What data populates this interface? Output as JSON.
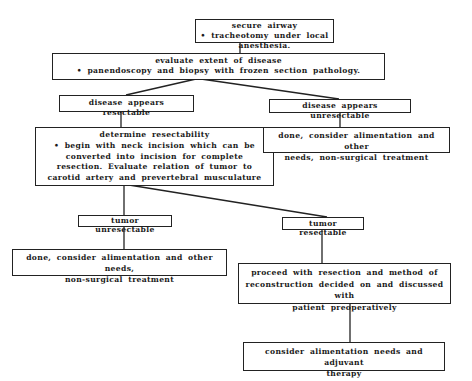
{
  "diagram": {
    "type": "flowchart",
    "nodes": {
      "secure_airway": {
        "title": "secure airway",
        "bullet": "• tracheotomy under local anesthesia."
      },
      "evaluate_extent": {
        "title": "evaluate extent of disease",
        "bullet": "• panendoscopy and biopsy with frozen section pathology."
      },
      "disease_resectable": {
        "label": "disease appears resectable"
      },
      "disease_unresectable": {
        "label": "disease appears unresectable"
      },
      "determine_resectability": {
        "title": "determine resectability",
        "lines": [
          "• begin with neck incision which can be",
          "converted into incision for complete",
          "resection.  Evaluate relation of tumor to",
          "carotid artery and prevertebral musculature"
        ]
      },
      "done_right": {
        "lines": [
          "done, consider alimentation and other",
          "needs, non-surgical treatment"
        ]
      },
      "tumor_unresectable": {
        "label": "tumor unresectable"
      },
      "tumor_resectable": {
        "label": "tumor resectable"
      },
      "done_left": {
        "lines": [
          "done, consider alimentation and other needs,",
          "non-surgical treatment"
        ]
      },
      "proceed_resection": {
        "lines": [
          "proceed with resection and method of",
          "reconstruction decided on and discussed with",
          "patient preoperatively"
        ]
      },
      "adjuvant": {
        "lines": [
          "consider alimentation needs and adjuvant",
          "therapy"
        ]
      }
    },
    "edges": [
      [
        "secure_airway",
        "evaluate_extent"
      ],
      [
        "evaluate_extent",
        "disease_resectable"
      ],
      [
        "evaluate_extent",
        "disease_unresectable"
      ],
      [
        "disease_resectable",
        "determine_resectability"
      ],
      [
        "disease_unresectable",
        "done_right"
      ],
      [
        "determine_resectability",
        "tumor_unresectable"
      ],
      [
        "determine_resectability",
        "tumor_resectable"
      ],
      [
        "tumor_unresectable",
        "done_left"
      ],
      [
        "tumor_resectable",
        "proceed_resection"
      ],
      [
        "proceed_resection",
        "adjuvant"
      ]
    ]
  }
}
